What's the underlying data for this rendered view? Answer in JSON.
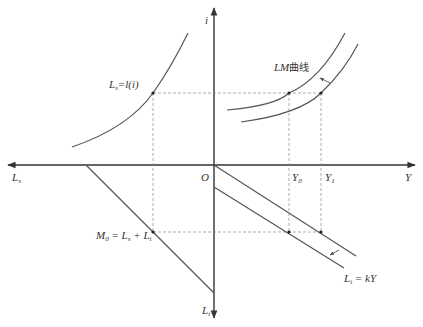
{
  "diagram": {
    "title": "",
    "axes": {
      "vertical_up_label": "i",
      "vertical_down_label": "L",
      "vertical_down_sub": "t",
      "horizontal_right_label": "Y",
      "horizontal_left_label": "L",
      "horizontal_left_sub": "s",
      "origin_label": "O"
    },
    "labels": {
      "speculative_demand": {
        "main": "L",
        "sub": "s",
        "rest": "=l(i)"
      },
      "lm_curve": {
        "main": "LM",
        "cn": "曲线"
      },
      "money_supply": {
        "main": "M",
        "sub0": "0",
        "eq": " = L",
        "sub1": "s",
        "plus": " + L",
        "sub2": "t"
      },
      "transaction_demand": {
        "main": "L",
        "sub": "t",
        "rest": " = kY"
      },
      "y0": {
        "main": "Y",
        "sub": "0"
      },
      "y1": {
        "main": "Y",
        "sub": "1"
      }
    },
    "colors": {
      "axis": "#333333",
      "curve": "#555555",
      "dashed": "#8a8a8a"
    }
  }
}
